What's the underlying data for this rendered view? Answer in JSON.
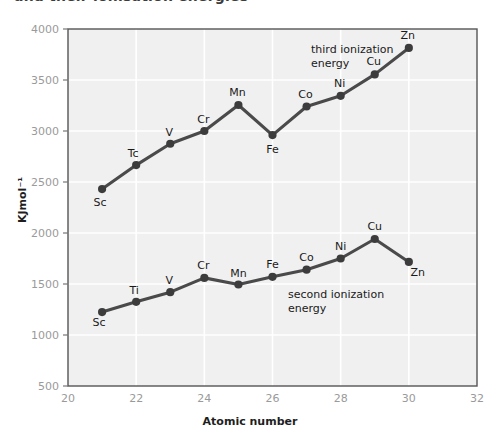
{
  "page": {
    "title_partial": "and their ionisation energies",
    "background_color": "#ffffff"
  },
  "chart_data": {
    "type": "line",
    "title": "",
    "xlabel": "Atomic number",
    "ylabel": "KJmol⁻¹",
    "xlim": [
      20,
      32
    ],
    "ylim": [
      500,
      4000
    ],
    "xticks": [
      20,
      22,
      24,
      26,
      28,
      30,
      32
    ],
    "ytick_labels": [
      "4000",
      "3500",
      "3000",
      "2500",
      "2000",
      "1500",
      "1000",
      "500"
    ],
    "yticks": [
      4000,
      3500,
      3000,
      2500,
      2000,
      1500,
      1000,
      500
    ],
    "grid": true,
    "grid_color": "#ffffff",
    "plot_background": "#f0f0f0",
    "legend_position": "inline-annotation",
    "line_color": "#4a4a4a",
    "marker_color": "#3c3c3c",
    "x": [
      21,
      22,
      23,
      24,
      25,
      26,
      27,
      28,
      29,
      30
    ],
    "series": [
      {
        "name": "third ionization energy",
        "annotation": "third ionization energy",
        "annotation_line1": "third ionization",
        "annotation_line2": "energy",
        "point_labels": [
          "Sc",
          "Tc",
          "V",
          "Cr",
          "Mn",
          "Fe",
          "Co",
          "Ni",
          "Cu",
          "Zn"
        ],
        "values": [
          2431,
          2666,
          2875,
          3000,
          3255,
          2960,
          3240,
          3345,
          3555,
          3814
        ]
      },
      {
        "name": "second ionization energy",
        "annotation": "second ionization energy",
        "annotation_line1": "second ionization",
        "annotation_line2": "energy",
        "point_labels": [
          "Sc",
          "Ti",
          "V",
          "Cr",
          "Mn",
          "Fe",
          "Co",
          "Ni",
          "Cu",
          "Zn"
        ],
        "values": [
          1225,
          1325,
          1420,
          1560,
          1495,
          1570,
          1640,
          1750,
          1941,
          1716
        ]
      }
    ]
  },
  "axis": {
    "x_title": "Atomic number",
    "y_title": "KJmol⁻¹"
  }
}
